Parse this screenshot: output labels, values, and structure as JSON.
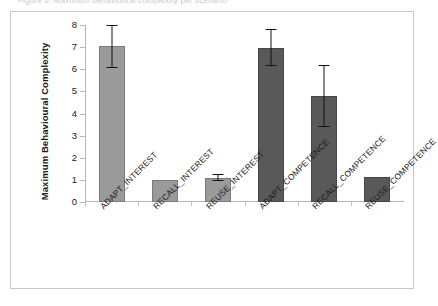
{
  "figure": {
    "caption_sliver": "Figure 6: Maximum behavioural complexity per scenario",
    "scan_artifact": "",
    "frame_color": "#c6c6c6",
    "background": "#ffffff"
  },
  "chart_data": {
    "type": "bar",
    "title": "",
    "xlabel": "",
    "ylabel": "Maximum Behavioural Complexity",
    "ylim": [
      0,
      8
    ],
    "yticks": [
      0,
      1,
      2,
      3,
      4,
      5,
      6,
      7,
      8
    ],
    "grid": false,
    "legend": "none",
    "categories": [
      "ADAPT_INTEREST",
      "RECALL_INTEREST",
      "REUSE_INTEREST",
      "ADAPT_COMPETENCE",
      "RECALL_COMPETENCE",
      "REUSE_COMPETENCE"
    ],
    "values": [
      7.05,
      1.0,
      1.1,
      6.95,
      4.8,
      1.15
    ],
    "error_low": [
      6.1,
      null,
      1.0,
      6.2,
      3.45,
      null
    ],
    "error_high": [
      8.0,
      null,
      1.25,
      7.8,
      6.2,
      null
    ],
    "bar_colors": [
      "#9a9a9a",
      "#9a9a9a",
      "#9a9a9a",
      "#595959",
      "#595959",
      "#595959"
    ],
    "error_color": "#111111",
    "axis_color": "#b5b5b5"
  }
}
